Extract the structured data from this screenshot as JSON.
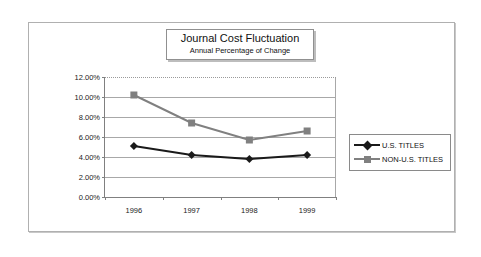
{
  "chart_data": {
    "type": "line",
    "title": "Journal Cost Fluctuation",
    "subtitle": "Annual Percentage of Change",
    "xlabel": "",
    "ylabel": "",
    "categories": [
      "1996",
      "1997",
      "1998",
      "1999"
    ],
    "ylim": [
      0,
      12
    ],
    "yticks": [
      "0.00%",
      "2.00%",
      "4.00%",
      "6.00%",
      "8.00%",
      "10.00%",
      "12.00%"
    ],
    "ytick_values": [
      0,
      2,
      4,
      6,
      8,
      10,
      12
    ],
    "grid": true,
    "legend_position": "right",
    "series": [
      {
        "name": "U.S. TITLES",
        "values": [
          5.1,
          4.2,
          3.8,
          4.2
        ],
        "color": "#1a1a1a",
        "marker": "diamond"
      },
      {
        "name": "NON-U.S. TITLES",
        "values": [
          10.2,
          7.4,
          5.7,
          6.6
        ],
        "color": "#808080",
        "marker": "square"
      }
    ]
  },
  "legend": {
    "items": [
      {
        "label": "U.S. TITLES"
      },
      {
        "label": "NON-U.S. TITLES"
      }
    ]
  },
  "colors": {
    "us_titles": "#1a1a1a",
    "non_us_titles": "#808080",
    "gridline": "#a8a8a8",
    "axis": "#808080",
    "frame": "#b0b0b0"
  }
}
